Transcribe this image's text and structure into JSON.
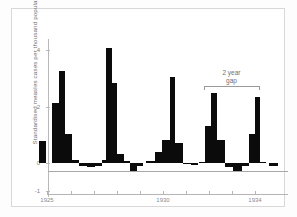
{
  "chart_data": {
    "type": "bar",
    "title": "",
    "subtitle": "",
    "xlabel": "",
    "ylabel": "Standardised measles cases per thousand population",
    "ylim": [
      -1,
      4.6
    ],
    "yticks": [
      -1,
      0,
      2,
      4
    ],
    "ytick_labels": [
      "-1",
      "0",
      "2",
      "4"
    ],
    "xlim": [
      1924.4,
      1934.9
    ],
    "xticks": [
      1925,
      1926,
      1927,
      1928,
      1929,
      1930,
      1931,
      1932,
      1933,
      1934
    ],
    "xtick_labels_shown": [
      "1925",
      "1930",
      "1934"
    ],
    "grid": false,
    "legend": null,
    "bar_color": "#0b0b0b",
    "axis_color": "#b5b5b5",
    "series_name": "Standardised measles cases per thousand population",
    "x": [
      1924.6,
      1924.85,
      1925.1,
      1925.35,
      1925.6,
      1925.85,
      1926.1,
      1926.35,
      1926.6,
      1926.85,
      1927.1,
      1927.35,
      1927.6,
      1927.85,
      1928.1,
      1928.35,
      1928.6,
      1928.85,
      1929.1,
      1929.35,
      1929.6,
      1929.85,
      1930.1,
      1930.35,
      1930.6,
      1930.85,
      1931.1,
      1931.35,
      1931.6,
      1931.85,
      1932.1,
      1932.35,
      1932.6,
      1932.85,
      1933.1,
      1933.35,
      1933.6,
      1933.85,
      1934.1,
      1934.45
    ],
    "values": [
      0.78,
      0.0,
      2.12,
      3.25,
      1.02,
      0.98,
      -0.12,
      -0.15,
      -0.14,
      -0.1,
      0.12,
      4.08,
      2.85,
      0.33,
      0.3,
      -0.06,
      -0.28,
      -0.24,
      0.0,
      0.0,
      0.38,
      0.82,
      3.05,
      0.72,
      0.7,
      -0.05,
      -0.06,
      -0.08,
      -0.02,
      0.0,
      1.32,
      2.48,
      0.8,
      0.78,
      -0.14,
      -0.24,
      -0.12,
      -0.1,
      1.02,
      -0.12
    ],
    "peak_values": [
      3.25,
      4.08,
      3.05,
      2.48,
      2.35
    ],
    "annotations": [
      {
        "label": "2 year\ngap",
        "line1": "2 year",
        "line2": "gap",
        "type": "bracket",
        "x_start": 1931.9,
        "x_end": 1933.95,
        "y": 2.75
      }
    ]
  },
  "bars": [
    {
      "x": 38,
      "w": 7,
      "v": 0.78
    },
    {
      "x": 45,
      "w": 5,
      "v": 0.0
    },
    {
      "x": 51,
      "w": 7,
      "v": 2.12
    },
    {
      "x": 58,
      "w": 6,
      "v": 3.25
    },
    {
      "x": 64,
      "w": 7,
      "v": 1.02
    },
    {
      "x": 71,
      "w": 7,
      "v": 0.1
    },
    {
      "x": 78,
      "w": 8,
      "v": -0.12
    },
    {
      "x": 86,
      "w": 8,
      "v": -0.15
    },
    {
      "x": 94,
      "w": 7,
      "v": -0.1
    },
    {
      "x": 101,
      "w": 4,
      "v": 0.12
    },
    {
      "x": 105,
      "w": 6,
      "v": 4.08
    },
    {
      "x": 111,
      "w": 5,
      "v": 2.85
    },
    {
      "x": 116,
      "w": 7,
      "v": 0.33
    },
    {
      "x": 123,
      "w": 6,
      "v": 0.06
    },
    {
      "x": 129,
      "w": 7,
      "v": -0.28
    },
    {
      "x": 136,
      "w": 6,
      "v": -0.1
    },
    {
      "x": 145,
      "w": 9,
      "v": 0.07
    },
    {
      "x": 154,
      "w": 7,
      "v": 0.38
    },
    {
      "x": 161,
      "w": 8,
      "v": 0.82
    },
    {
      "x": 169,
      "w": 5,
      "v": 3.05
    },
    {
      "x": 174,
      "w": 8,
      "v": 0.72
    },
    {
      "x": 182,
      "w": 8,
      "v": -0.05
    },
    {
      "x": 190,
      "w": 7,
      "v": -0.08
    },
    {
      "x": 198,
      "w": 6,
      "v": 0.04
    },
    {
      "x": 204,
      "w": 6,
      "v": 1.32
    },
    {
      "x": 210,
      "w": 6,
      "v": 2.48
    },
    {
      "x": 216,
      "w": 8,
      "v": 0.8
    },
    {
      "x": 224,
      "w": 8,
      "v": -0.14
    },
    {
      "x": 232,
      "w": 9,
      "v": -0.3
    },
    {
      "x": 241,
      "w": 7,
      "v": -0.12
    },
    {
      "x": 248,
      "w": 6,
      "v": 1.02
    },
    {
      "x": 254,
      "w": 5,
      "v": 2.35
    },
    {
      "x": 259,
      "w": 6,
      "v": 0.04
    },
    {
      "x": 268,
      "w": 9,
      "v": -0.12
    }
  ],
  "yticks": [
    {
      "label": "4",
      "v": 4
    },
    {
      "label": "2",
      "v": 2
    },
    {
      "label": "0",
      "v": 0
    },
    {
      "label": "-1",
      "v": -1
    }
  ],
  "xticks": [
    {
      "px": 46,
      "label": "1925"
    },
    {
      "px": 70,
      "label": ""
    },
    {
      "px": 93,
      "label": ""
    },
    {
      "px": 116,
      "label": ""
    },
    {
      "px": 139,
      "label": ""
    },
    {
      "px": 162,
      "label": "1930"
    },
    {
      "px": 185,
      "label": ""
    },
    {
      "px": 208,
      "label": ""
    },
    {
      "px": 231,
      "label": ""
    },
    {
      "px": 254,
      "label": "1934"
    }
  ],
  "annotation": {
    "line1": "2 year",
    "line2": "gap",
    "bracket_left": 203,
    "bracket_right": 258,
    "bracket_top": 85
  }
}
